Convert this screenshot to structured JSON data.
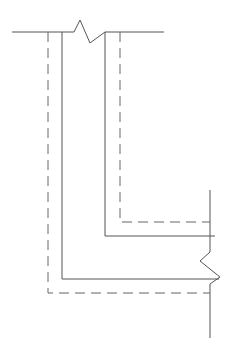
{
  "diagram": {
    "type": "break-line section drawing (L-shaped wall corner with hidden lines)",
    "canvas": {
      "width": 232,
      "height": 353,
      "background": "#ffffff"
    },
    "stroke_color": "#555555",
    "dash_pattern": "10 6",
    "elements": {
      "top_break_line": {
        "points": "12,32 74,32 80,20 90,43 105,32 164,32"
      },
      "right_break_line": {
        "points": "210,190 210,252 200,261 220,277 210,284 210,338"
      },
      "outer_solid": {
        "points": "62,32 62,279 219,279"
      },
      "inner_solid": {
        "points": "105,32 105,236 215,236"
      },
      "outer_dashed": {
        "points": "48,32 48,293 210,293"
      },
      "inner_dashed": {
        "points": "120,32 120,222 210,222"
      }
    }
  }
}
